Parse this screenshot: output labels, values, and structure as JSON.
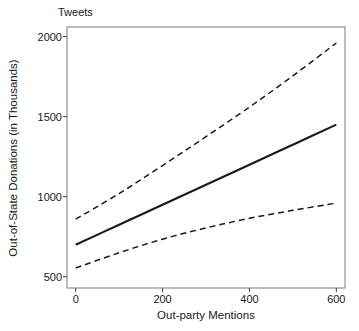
{
  "chart_data": {
    "type": "line",
    "title": "Tweets",
    "xlabel": "Out-party Mentions",
    "ylabel": "Out-of-State Donations (in Thousands)",
    "xlim": [
      -20,
      620
    ],
    "ylim": [
      430,
      2060
    ],
    "xticks": [
      0,
      200,
      400,
      600
    ],
    "xtick_labels": [
      "0",
      "200",
      "400",
      "600"
    ],
    "yticks": [
      500,
      1000,
      1500,
      2000
    ],
    "ytick_labels": [
      "500",
      "1000",
      "1500",
      "2000"
    ],
    "grid": false,
    "legend": "none",
    "line_color": "#1a1a1a",
    "series": [
      {
        "name": "Predicted Out-of-State Donations",
        "style": "solid",
        "x": [
          0,
          100,
          200,
          300,
          400,
          500,
          600
        ],
        "values": [
          700,
          825,
          950,
          1075,
          1200,
          1325,
          1450
        ]
      },
      {
        "name": "Upper 95% Confidence Interval",
        "style": "dashed",
        "x": [
          0,
          100,
          200,
          300,
          400,
          500,
          600
        ],
        "values": [
          860,
          1020,
          1195,
          1375,
          1560,
          1755,
          1960
        ]
      },
      {
        "name": "Lower 95% Confidence Interval",
        "style": "dashed",
        "x": [
          0,
          100,
          200,
          300,
          400,
          500,
          600
        ],
        "values": [
          555,
          650,
          735,
          805,
          865,
          915,
          960
        ]
      }
    ]
  }
}
